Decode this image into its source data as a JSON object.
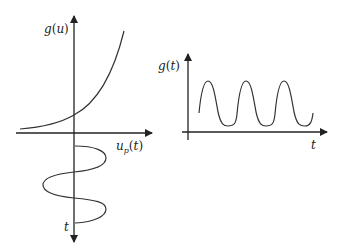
{
  "left_diagram": {
    "vertical_axis_label": "g(u)",
    "horizontal_axis_label": "u_p(t)",
    "horizontal_axis_label_main": "u",
    "horizontal_axis_label_sub": "p",
    "horizontal_axis_label_rest": "(t)",
    "downward_axis_label": "t",
    "curve_upper": "exponential g(u)",
    "curve_lower": "sinusoidal input u_p(t) vs time"
  },
  "right_diagram": {
    "vertical_axis_label": "g(t)",
    "horizontal_axis_label": "t",
    "curve": "periodic output g(t), 3 peaks"
  },
  "colors": {
    "stroke": "#333333",
    "background": "#ffffff"
  }
}
